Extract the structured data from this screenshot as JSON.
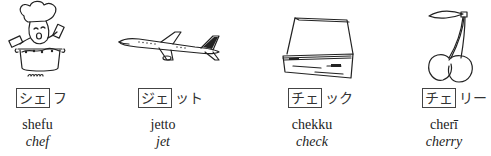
{
  "items": [
    {
      "image": "chef-cooking-illustration",
      "kana_boxed": "シェ",
      "kana_rest": "フ",
      "romaji": "shefu",
      "english": "chef"
    },
    {
      "image": "jet-airplane-illustration",
      "kana_boxed": "ジェ",
      "kana_rest": "ット",
      "romaji": "jetto",
      "english": "jet"
    },
    {
      "image": "checkbook-illustration",
      "kana_boxed": "チェ",
      "kana_rest": "ック",
      "romaji": "chekku",
      "english": "check"
    },
    {
      "image": "cherries-illustration",
      "kana_boxed": "チェ",
      "kana_rest": "リー",
      "romaji": "cherī",
      "english": "cherry"
    }
  ]
}
